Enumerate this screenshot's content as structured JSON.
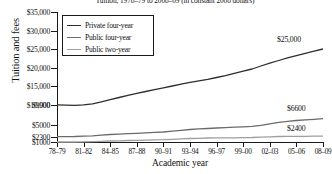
{
  "chart_data": {
    "type": "line",
    "title": "Tuition, 1978–79 to 2008–09 (in constant 2008 dollars)",
    "xlabel": "Academic year",
    "ylabel": "Tuition and fees",
    "grid": false,
    "legend_position": "top-left",
    "ylim": [
      1000,
      35000
    ],
    "yticks": [
      "$1000",
      "$2300",
      "$5000",
      "$9900",
      "$10,000",
      "$15,000",
      "$20,000",
      "$25,000",
      "$30,000",
      "$35,000"
    ],
    "ytick_values": [
      1000,
      2300,
      5000,
      9900,
      10000,
      15000,
      20000,
      25000,
      30000,
      35000
    ],
    "categories": [
      "78–79",
      "79–80",
      "80–81",
      "81–82",
      "82–83",
      "83–84",
      "84–85",
      "85–86",
      "86–87",
      "87–88",
      "88–89",
      "89–90",
      "90–91",
      "91–92",
      "92–93",
      "93–94",
      "94–95",
      "95–96",
      "96–97",
      "97–98",
      "98–99",
      "99–00",
      "00–01",
      "01–02",
      "02–03",
      "03–04",
      "04–05",
      "05–06",
      "06–07",
      "07–08",
      "08–09"
    ],
    "xtick_labels": [
      "78–79",
      "81–82",
      "84–85",
      "87–88",
      "90–91",
      "93–94",
      "96–97",
      "99–00",
      "02–03",
      "05–06",
      "08–09"
    ],
    "series": [
      {
        "name": "Private four-year",
        "color": "#2e2e2e",
        "start_value": 9900,
        "end_value": 25000,
        "values": [
          9900,
          9850,
          9800,
          9900,
          10200,
          10700,
          11300,
          11900,
          12500,
          13000,
          13500,
          14000,
          14500,
          15000,
          15500,
          16000,
          16400,
          16800,
          17300,
          17800,
          18400,
          19000,
          19600,
          20400,
          21200,
          21900,
          22600,
          23200,
          23800,
          24400,
          25000
        ]
      },
      {
        "name": "Public four-year",
        "color": "#6b6b6b",
        "start_value": 2300,
        "end_value": 6600,
        "values": [
          2300,
          2300,
          2320,
          2400,
          2500,
          2650,
          2800,
          2900,
          3000,
          3100,
          3200,
          3300,
          3400,
          3600,
          3800,
          4000,
          4150,
          4250,
          4350,
          4450,
          4550,
          4650,
          4750,
          5000,
          5350,
          5700,
          5950,
          6150,
          6300,
          6450,
          6600
        ]
      },
      {
        "name": "Public two-year",
        "color": "#9e9e9e",
        "start_value": 1000,
        "end_value": 2400,
        "values": [
          1000,
          1000,
          1010,
          1050,
          1100,
          1180,
          1250,
          1300,
          1350,
          1400,
          1450,
          1500,
          1550,
          1650,
          1750,
          1850,
          1900,
          1950,
          1980,
          2000,
          2020,
          2050,
          2080,
          2150,
          2250,
          2320,
          2350,
          2370,
          2380,
          2390,
          2400
        ]
      }
    ],
    "annotations": [
      {
        "text": "$25,000",
        "series": "Private four-year"
      },
      {
        "text": "$6600",
        "series": "Public four-year"
      },
      {
        "text": "$2400",
        "series": "Public two-year"
      }
    ]
  }
}
